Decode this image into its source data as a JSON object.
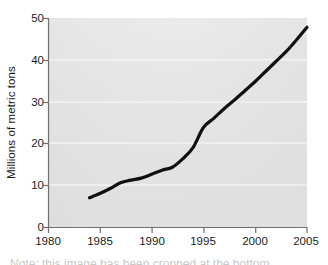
{
  "chart_data": {
    "type": "line",
    "title": "",
    "xlabel": "",
    "ylabel": "Millions of metric tons",
    "xlim": [
      1980,
      2005
    ],
    "ylim": [
      0,
      50
    ],
    "xticks": [
      1980,
      1985,
      1990,
      1995,
      2000,
      2005
    ],
    "yticks": [
      0,
      10,
      20,
      30,
      40,
      50
    ],
    "grid": "horizontal",
    "legend": "none",
    "line_color": "#101010",
    "plot_background": "#e6e6e6",
    "series": [
      {
        "name": "production",
        "x": [
          1984,
          1985,
          1986,
          1987,
          1988,
          1989,
          1990,
          1991,
          1992,
          1993,
          1994,
          1995,
          1996,
          1997,
          1998,
          1999,
          2000,
          2001,
          2002,
          2003,
          2004,
          2005
        ],
        "values": [
          7.0,
          8.0,
          9.2,
          10.6,
          11.2,
          11.7,
          12.6,
          13.6,
          14.3,
          16.3,
          19.0,
          23.8,
          26.0,
          28.3,
          30.4,
          32.6,
          34.8,
          37.2,
          39.6,
          42.0,
          44.8,
          47.8
        ]
      }
    ]
  },
  "axes": {
    "ylabel_text": "Millions of metric tons",
    "ytick_labels": [
      "50",
      "40",
      "30",
      "20",
      "10",
      "0"
    ],
    "xtick_labels": [
      "1980",
      "1985",
      "1990",
      "1995",
      "2000",
      "2005"
    ]
  },
  "caption": {
    "remnant": "Note: this image has been cropped at the bottom"
  }
}
